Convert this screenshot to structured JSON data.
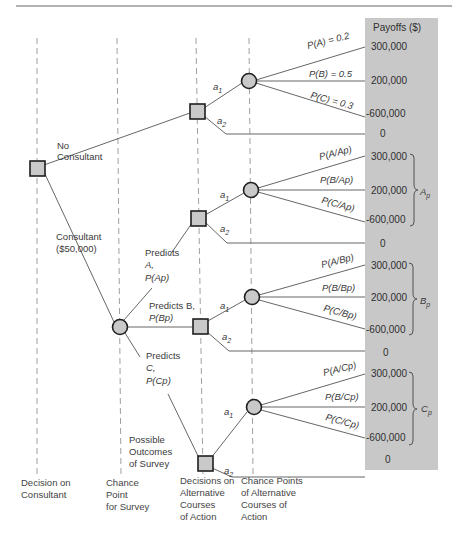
{
  "diagram": {
    "type": "decision-tree",
    "panel_color": "#c8c8c8",
    "node_fill": "#c9c9c9",
    "payoffs_header": "Payoffs ($)",
    "columns": [
      {
        "id": "decision-on-consultant",
        "lines": [
          "Decision on",
          "Consultant"
        ]
      },
      {
        "id": "chance-point-for-survey",
        "lines": [
          "Chance",
          "Point",
          "for Survey"
        ]
      },
      {
        "id": "decisions-on-alternatives",
        "lines": [
          "Decisions on",
          "Alternative",
          "Courses",
          "of Action"
        ]
      },
      {
        "id": "chance-points-alternatives",
        "lines": [
          "Chance Points",
          "of Alternative",
          "Courses of",
          "Action"
        ]
      }
    ],
    "root_branches": {
      "no_consultant": [
        "No",
        "Consultant"
      ],
      "consultant": [
        "Consultant",
        "($50,000)"
      ]
    },
    "survey_outcomes_label": [
      "Possible",
      "Outcomes",
      "of Survey"
    ],
    "survey_branches": {
      "A": [
        "Predicts",
        "A,",
        "P(Ap)"
      ],
      "B": [
        "Predicts B,",
        "P(Bp)"
      ],
      "C": [
        "Predicts",
        "C,",
        "P(Cp)"
      ]
    },
    "actions": {
      "a1": "a",
      "a1_sub": "1",
      "a2": "a",
      "a2_sub": "2"
    },
    "blocks": [
      {
        "id": "no-consultant",
        "probs": [
          "P(A) = 0.2",
          "P(B) = 0.5",
          "P(C) = 0.3"
        ],
        "payoffs": [
          "300,000",
          "200,000",
          "-600,000"
        ],
        "a2_payoff": "0",
        "brace_label": ""
      },
      {
        "id": "predict-A",
        "probs": [
          "P(A/Ap)",
          "P(B/Ap)",
          "P(C/Ap)"
        ],
        "payoffs": [
          "300,000",
          "200,000",
          "-600,000"
        ],
        "a2_payoff": "0",
        "brace_label": "Ap"
      },
      {
        "id": "predict-B",
        "probs": [
          "P(A/Bp)",
          "P(B/Bp)",
          "P(C/Bp)"
        ],
        "payoffs": [
          "300,000",
          "200,000",
          "-600,000"
        ],
        "a2_payoff": "0",
        "brace_label": "Bp"
      },
      {
        "id": "predict-C",
        "probs": [
          "P(A/Cp)",
          "P(B/Cp)",
          "P(C/Cp)"
        ],
        "payoffs": [
          "300,000",
          "200,000",
          "-600,000"
        ],
        "a2_payoff": "0",
        "brace_label": "Cp"
      }
    ]
  }
}
